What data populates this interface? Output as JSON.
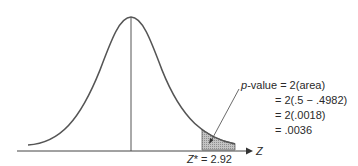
{
  "diagram": {
    "type": "normal-distribution-two-tailed-p-value",
    "axis_label": "Z",
    "critical_label": "Z* = 2.92",
    "critical_value": 2.92,
    "annotation": {
      "line1_prefix": "p",
      "line1_rest": "-value = 2(area)",
      "line2": "= 2(.5 − .4982)",
      "line3": "= 2(.0018)",
      "line4": "= .0036"
    },
    "colors": {
      "curve": "#555555",
      "axis": "#444444",
      "shade": "#b5b5b5",
      "text": "#2a2a2a"
    }
  }
}
